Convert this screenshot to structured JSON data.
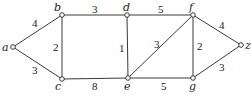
{
  "graph": {
    "nodes": [
      {
        "id": "a",
        "label": "a",
        "x": 13,
        "y": 47
      },
      {
        "id": "b",
        "label": "b",
        "x": 62,
        "y": 15
      },
      {
        "id": "c",
        "label": "c",
        "x": 62,
        "y": 79
      },
      {
        "id": "d",
        "label": "d",
        "x": 127,
        "y": 15
      },
      {
        "id": "e",
        "label": "e",
        "x": 128,
        "y": 78
      },
      {
        "id": "f",
        "label": "f",
        "x": 193,
        "y": 15
      },
      {
        "id": "g",
        "label": "g",
        "x": 193,
        "y": 78
      },
      {
        "id": "z",
        "label": "z",
        "x": 241,
        "y": 45
      }
    ],
    "edges": [
      {
        "from": "a",
        "to": "b",
        "weight": "4"
      },
      {
        "from": "a",
        "to": "c",
        "weight": "3"
      },
      {
        "from": "b",
        "to": "c",
        "weight": "2"
      },
      {
        "from": "b",
        "to": "d",
        "weight": "3"
      },
      {
        "from": "c",
        "to": "e",
        "weight": "8"
      },
      {
        "from": "d",
        "to": "e",
        "weight": "1"
      },
      {
        "from": "d",
        "to": "f",
        "weight": "5"
      },
      {
        "from": "e",
        "to": "f",
        "weight": "3"
      },
      {
        "from": "e",
        "to": "g",
        "weight": "5"
      },
      {
        "from": "f",
        "to": "g",
        "weight": "2"
      },
      {
        "from": "f",
        "to": "z",
        "weight": "4"
      },
      {
        "from": "g",
        "to": "z",
        "weight": "3"
      }
    ]
  }
}
